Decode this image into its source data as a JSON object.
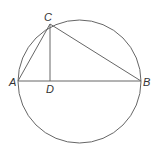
{
  "diagram": {
    "type": "geometry",
    "circle": {
      "cx": 79.5,
      "cy": 81.5,
      "r": 61.5
    },
    "points": {
      "A": {
        "label": "A",
        "x": 18,
        "y": 81
      },
      "B": {
        "label": "B",
        "x": 141,
        "y": 81
      },
      "C": {
        "label": "C",
        "x": 50,
        "y": 24
      },
      "D": {
        "label": "D",
        "x": 50,
        "y": 81
      }
    },
    "segments": [
      [
        "A",
        "B"
      ],
      [
        "A",
        "C"
      ],
      [
        "C",
        "B"
      ],
      [
        "C",
        "D"
      ]
    ],
    "colors": {
      "line": "#666666",
      "label": "#333333",
      "background": "#ffffff"
    }
  }
}
